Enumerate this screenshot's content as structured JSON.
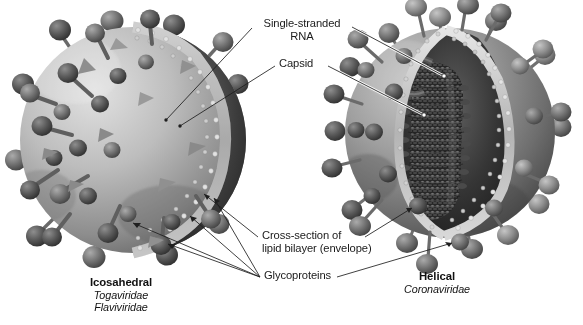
{
  "figure": {
    "background_color": "#ffffff",
    "palette": {
      "ink": "#1a1a1a",
      "leader_line": "#222222",
      "leader_outline": "#ffffff",
      "envelope_light": "#cfcfcf",
      "envelope_mid": "#9a9a9a",
      "envelope_dark": "#5a5a5a",
      "spike_light": "#a8a8a8",
      "spike_dark": "#4a4a4a",
      "capsid_dark": "#3b3b3b",
      "bilayer_bead": "#d8d8d8",
      "interior_shadow": "#2b2b2b"
    }
  },
  "labels": [
    {
      "id": "single-stranded-rna",
      "text_line1": "Single-stranded",
      "text_line2": "RNA",
      "x": 256,
      "y": 22
    },
    {
      "id": "capsid",
      "text_line1": "Capsid",
      "text_line2": "",
      "x": 279,
      "y": 60
    },
    {
      "id": "cross-section-lipid-bilayer",
      "text_line1": "Cross-section of",
      "text_line2": "lipid bilayer (envelope)",
      "x": 262,
      "y": 231
    },
    {
      "id": "glycoproteins",
      "text_line1": "Glycoproteins",
      "text_line2": "",
      "x": 264,
      "y": 272
    }
  ],
  "captions": [
    {
      "id": "left-virus-caption",
      "title": "Icosahedral",
      "families": [
        "Togaviridae",
        "Flaviviridae"
      ],
      "x": 121,
      "y": 278
    },
    {
      "id": "right-virus-caption",
      "title": "Helical",
      "families": [
        "Coronaviridae"
      ],
      "x": 437,
      "y": 272
    }
  ],
  "particles": [
    {
      "id": "icosahedral-virus",
      "symmetry": "Icosahedral",
      "families": [
        "Togaviridae",
        "Flaviviridae"
      ],
      "center_x": 133,
      "center_y": 140,
      "radius": 113,
      "spike_shape": "mushroom-short-stalk",
      "core": "icosahedral-capsid",
      "genome": "single-stranded RNA"
    },
    {
      "id": "helical-virus",
      "symmetry": "Helical",
      "families": [
        "Coronaviridae"
      ],
      "center_x": 450,
      "center_y": 133,
      "radius": 105,
      "spike_shape": "club-long-stalk",
      "core": "helical-nucleocapsid",
      "genome": "single-stranded RNA"
    }
  ]
}
